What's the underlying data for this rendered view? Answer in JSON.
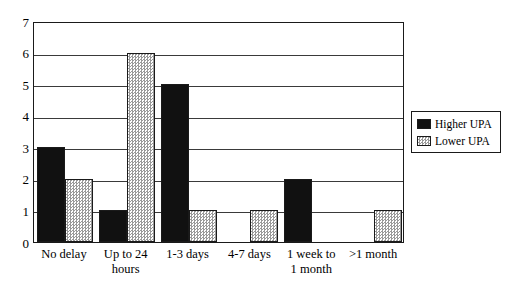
{
  "chart_data": {
    "type": "bar",
    "title": "",
    "subtitle": "",
    "xlabel": "",
    "ylabel": "",
    "categories": [
      "No delay",
      "Up to 24 hours",
      "1-3 days",
      "4-7 days",
      "1 week to 1 month",
      ">1 month"
    ],
    "category_lines": [
      [
        "No delay"
      ],
      [
        "Up to 24",
        "hours"
      ],
      [
        "1-3 days"
      ],
      [
        "4-7 days"
      ],
      [
        "1 week to",
        "1 month"
      ],
      [
        ">1 month"
      ]
    ],
    "series": [
      {
        "name": "Higher UPA",
        "values": [
          3,
          1,
          5,
          0,
          2,
          0
        ],
        "color": "#111111",
        "fill": "solid-black"
      },
      {
        "name": "Lower UPA",
        "values": [
          2,
          6,
          1,
          1,
          0,
          1
        ],
        "color": "#9a9a9a",
        "fill": "dotted-gray"
      }
    ],
    "ylim": [
      0,
      7
    ],
    "y_ticks": [
      0,
      1,
      2,
      3,
      4,
      5,
      6,
      7
    ],
    "y_tick_labels": [
      "0",
      "1",
      "2",
      "3",
      "4",
      "5",
      "6",
      "7"
    ],
    "grid": true,
    "grid_axis": "y",
    "legend_position": "right",
    "frame_color": "#1a1a1a",
    "background": "#ffffff"
  },
  "legend": {
    "items": [
      {
        "label": "Higher UPA",
        "swatch": "solid-black-swatch"
      },
      {
        "label": "Lower UPA",
        "swatch": "dotted-gray-swatch"
      }
    ]
  }
}
